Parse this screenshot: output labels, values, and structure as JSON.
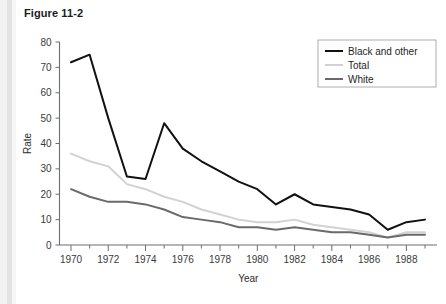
{
  "figure": {
    "title": "Figure 11-2"
  },
  "chart_data": {
    "type": "line",
    "title": "Figure 11-2",
    "xlabel": "Year",
    "ylabel": "Rate",
    "xlim": [
      1969.5,
      1989.5
    ],
    "ylim": [
      0,
      80
    ],
    "y_ticks": [
      0,
      10,
      20,
      30,
      40,
      50,
      60,
      70,
      80
    ],
    "x_ticks_major": [
      1970,
      1972,
      1974,
      1976,
      1978,
      1980,
      1982,
      1984,
      1986,
      1988
    ],
    "x_ticks_minor": [
      1971,
      1973,
      1975,
      1977,
      1979,
      1981,
      1983,
      1985,
      1987,
      1989
    ],
    "grid": false,
    "legend_position": "upper right",
    "x": [
      1970,
      1971,
      1972,
      1973,
      1974,
      1975,
      1976,
      1977,
      1978,
      1979,
      1980,
      1981,
      1982,
      1983,
      1984,
      1985,
      1986,
      1987,
      1988,
      1989
    ],
    "series": [
      {
        "name": "Black and other",
        "color": "#111111",
        "width": 2.0,
        "values": [
          72,
          75,
          50,
          27,
          26,
          48,
          38,
          33,
          29,
          25,
          22,
          16,
          20,
          16,
          15,
          14,
          12,
          6,
          9,
          10
        ]
      },
      {
        "name": "Total",
        "color": "#d2d2d2",
        "width": 2.0,
        "values": [
          36,
          33,
          31,
          24,
          22,
          19,
          17,
          14,
          12,
          10,
          9,
          9,
          10,
          8,
          7,
          6,
          5,
          3,
          5,
          5
        ]
      },
      {
        "name": "White",
        "color": "#6a6a6a",
        "width": 2.0,
        "values": [
          22,
          19,
          17,
          17,
          16,
          14,
          11,
          10,
          9,
          7,
          7,
          6,
          7,
          6,
          5,
          5,
          4,
          3,
          4,
          4
        ]
      }
    ]
  },
  "legend": {
    "entries": [
      {
        "label": "Black and other"
      },
      {
        "label": "Total"
      },
      {
        "label": "White"
      }
    ]
  }
}
